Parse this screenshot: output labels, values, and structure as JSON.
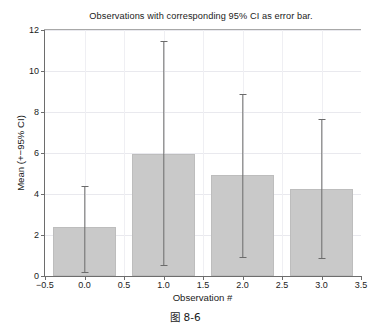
{
  "chart_data": {
    "type": "bar",
    "title": "Observations with corresponding 95% CI as error bar.",
    "xlabel": "Observation #",
    "ylabel": "Mean (+−95% CI)",
    "categories": [
      "0.0",
      "1.0",
      "2.0",
      "3.0"
    ],
    "x": [
      0,
      1,
      2,
      3
    ],
    "values": [
      2.39,
      5.95,
      4.93,
      4.24
    ],
    "error_low": [
      0.2,
      0.54,
      0.93,
      0.88
    ],
    "error_high": [
      4.39,
      11.46,
      8.88,
      7.66
    ],
    "bar_width": 0.8,
    "xlim": [
      -0.5,
      3.5
    ],
    "ylim": [
      0,
      12
    ],
    "xticks": [
      -0.5,
      0.0,
      0.5,
      1.0,
      1.5,
      2.0,
      2.5,
      3.0,
      3.5
    ],
    "xticklabels": [
      "−0.5",
      "0.0",
      "0.5",
      "1.0",
      "1.5",
      "2.0",
      "2.5",
      "3.0",
      "3.5"
    ],
    "yticks": [
      0,
      2,
      4,
      6,
      8,
      10,
      12
    ],
    "yticklabels": [
      "0",
      "2",
      "4",
      "6",
      "8",
      "10",
      "12"
    ],
    "grid": true,
    "legend": null,
    "bar_color": "#c9c9c9",
    "bar_edge_color": "#bdbdbd",
    "errorbar_color": "#6b6b6b",
    "axis_color": "#6d6d6d",
    "grid_color": "#e9e9ee"
  },
  "caption": {
    "text": "图 8-6"
  }
}
